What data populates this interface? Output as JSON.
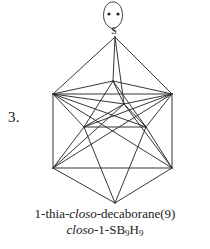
{
  "figure": {
    "item_number": "3.",
    "atom_label": "S",
    "lone_pair_dots": 2,
    "caption": {
      "line1_parts": [
        {
          "text": "1-thia-",
          "italic": false
        },
        {
          "text": "closo",
          "italic": true
        },
        {
          "text": "-decaborane(9)",
          "italic": false
        }
      ],
      "line2_parts": [
        {
          "text": "closo",
          "italic": true
        },
        {
          "text": "-1-SB",
          "italic": false
        },
        {
          "text": "9",
          "italic": false,
          "sub": true
        },
        {
          "text": "H",
          "italic": false
        },
        {
          "text": "9",
          "italic": false,
          "sub": true
        }
      ],
      "line1_plain": "1-thia-closo-decaborane(9)",
      "line2_plain": "closo-1-SB9H9"
    },
    "colors": {
      "stroke": "#2b2b2b",
      "background": "#ffffff",
      "text": "#1a1a1a"
    },
    "structure": {
      "name": "closo-1-SB9H9 polyhedron",
      "description": "bicapped square antiprism wireframe, sulfur at top apex",
      "vertices": [
        {
          "id": "S",
          "x": 115,
          "y": 37,
          "label": "S"
        },
        {
          "id": "B2",
          "x": 53,
          "y": 94,
          "label": ""
        },
        {
          "id": "B3",
          "x": 172,
          "y": 94,
          "label": ""
        },
        {
          "id": "B4",
          "x": 113,
          "y": 81,
          "label": ""
        },
        {
          "id": "B5",
          "x": 124,
          "y": 104,
          "label": ""
        },
        {
          "id": "B6",
          "x": 84,
          "y": 127,
          "label": ""
        },
        {
          "id": "B7",
          "x": 146,
          "y": 127,
          "label": ""
        },
        {
          "id": "B8",
          "x": 53,
          "y": 168,
          "label": ""
        },
        {
          "id": "B9",
          "x": 172,
          "y": 168,
          "label": ""
        },
        {
          "id": "B10",
          "x": 115,
          "y": 203,
          "label": ""
        }
      ],
      "edges": [
        [
          "S",
          "B2"
        ],
        [
          "S",
          "B3"
        ],
        [
          "S",
          "B4"
        ],
        [
          "S",
          "B5"
        ],
        [
          "B2",
          "B3"
        ],
        [
          "B2",
          "B4"
        ],
        [
          "B2",
          "B5"
        ],
        [
          "B2",
          "B6"
        ],
        [
          "B2",
          "B7"
        ],
        [
          "B2",
          "B8"
        ],
        [
          "B2",
          "B9"
        ],
        [
          "B3",
          "B4"
        ],
        [
          "B3",
          "B5"
        ],
        [
          "B3",
          "B6"
        ],
        [
          "B3",
          "B7"
        ],
        [
          "B3",
          "B8"
        ],
        [
          "B3",
          "B9"
        ],
        [
          "B4",
          "B5"
        ],
        [
          "B4",
          "B6"
        ],
        [
          "B4",
          "B7"
        ],
        [
          "B5",
          "B6"
        ],
        [
          "B5",
          "B7"
        ],
        [
          "B5",
          "B9"
        ],
        [
          "B6",
          "B7"
        ],
        [
          "B6",
          "B8"
        ],
        [
          "B6",
          "B10"
        ],
        [
          "B7",
          "B9"
        ],
        [
          "B7",
          "B10"
        ],
        [
          "B8",
          "B9"
        ],
        [
          "B8",
          "B10"
        ],
        [
          "B9",
          "B10"
        ],
        [
          "B8",
          "B5"
        ]
      ],
      "lone_pair": {
        "center_x": 113,
        "center_y": 15,
        "lobe_width": 17,
        "lobe_height": 26,
        "dot_left_x": 109,
        "dot_right_x": 118,
        "dot_y": 14,
        "dot_radius": 1.6
      }
    }
  }
}
